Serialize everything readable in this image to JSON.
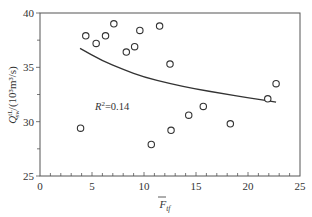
{
  "chart_data": {
    "type": "scatter",
    "title": "",
    "xlabel": "F̄tf",
    "xlabel_main": "F",
    "xlabel_sub": "tf",
    "ylabel": "Q^tL_sw/(10³m³/s)",
    "ylabel_main": "Q",
    "ylabel_sup": "tL",
    "ylabel_sub": "sw",
    "ylabel_units": "/(10³m³/s)",
    "xlim": [
      0,
      25
    ],
    "ylim": [
      25,
      40
    ],
    "xticks": [
      0,
      5,
      10,
      15,
      20,
      25
    ],
    "yticks": [
      25,
      30,
      35,
      40
    ],
    "xtick_labels": [
      "0",
      "5",
      "10",
      "15",
      "20",
      "25"
    ],
    "ytick_labels": [
      "25",
      "30",
      "35",
      "40"
    ],
    "grid": false,
    "legend": null,
    "series": [
      {
        "name": "observations",
        "marker": "open-circle",
        "points": [
          {
            "x": 3.9,
            "y": 29.4
          },
          {
            "x": 4.4,
            "y": 37.9
          },
          {
            "x": 5.4,
            "y": 37.2
          },
          {
            "x": 6.3,
            "y": 37.9
          },
          {
            "x": 7.1,
            "y": 39.0
          },
          {
            "x": 8.3,
            "y": 36.4
          },
          {
            "x": 9.1,
            "y": 36.9
          },
          {
            "x": 9.6,
            "y": 38.4
          },
          {
            "x": 10.7,
            "y": 27.9
          },
          {
            "x": 11.5,
            "y": 38.8
          },
          {
            "x": 12.5,
            "y": 35.3
          },
          {
            "x": 12.6,
            "y": 29.2
          },
          {
            "x": 14.3,
            "y": 30.6
          },
          {
            "x": 15.7,
            "y": 31.4
          },
          {
            "x": 18.3,
            "y": 29.8
          },
          {
            "x": 21.9,
            "y": 32.1
          },
          {
            "x": 22.7,
            "y": 33.5
          }
        ]
      },
      {
        "name": "fit",
        "style": "line",
        "points": [
          {
            "x": 3.85,
            "y": 36.75
          },
          {
            "x": 6.0,
            "y": 35.6
          },
          {
            "x": 8.0,
            "y": 34.8
          },
          {
            "x": 10.0,
            "y": 34.1
          },
          {
            "x": 12.5,
            "y": 33.5
          },
          {
            "x": 15.0,
            "y": 33.0
          },
          {
            "x": 17.5,
            "y": 32.6
          },
          {
            "x": 20.0,
            "y": 32.2
          },
          {
            "x": 22.7,
            "y": 31.8
          }
        ]
      }
    ],
    "annotations": [
      {
        "text": "R²=0.14",
        "main": "R",
        "sup": "2",
        "rest": "=0.14",
        "x": 5.3,
        "y": 31.5
      }
    ]
  }
}
